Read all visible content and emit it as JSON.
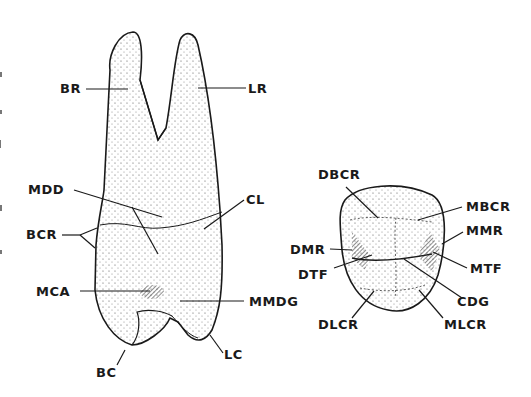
{
  "figure": {
    "left_view": {
      "name": "buccal-view",
      "labels": {
        "BR": "BR",
        "LR": "LR",
        "MDD": "MDD",
        "CL": "CL",
        "BCR": "BCR",
        "MCA": "MCA",
        "MMDG": "MMDG",
        "BC": "BC",
        "LC": "LC"
      }
    },
    "right_view": {
      "name": "occlusal-view",
      "labels": {
        "DBCR": "DBCR",
        "MBCR": "MBCR",
        "DMR": "DMR",
        "MMR": "MMR",
        "DTF": "DTF",
        "MTF": "MTF",
        "CDG": "CDG",
        "DLCR": "DLCR",
        "MLCR": "MLCR"
      }
    },
    "colors": {
      "ink": "#1a1a1a",
      "stipple": "#444444",
      "background": "#ffffff"
    }
  }
}
